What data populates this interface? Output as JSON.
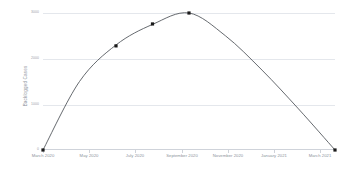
{
  "chart_data": {
    "type": "line",
    "title": "",
    "xlabel": "",
    "ylabel": "Backlogged Cases",
    "grid": true,
    "legend": false,
    "x_tick_labels": [
      "March 2020",
      "May 2020",
      "July 2020",
      "September 2020",
      "November 2020",
      "January 2021",
      "March 2021"
    ],
    "y_tick_labels": [
      "3000",
      "2000",
      "1000",
      "0"
    ],
    "ylim": [
      0,
      3000
    ],
    "series": [
      {
        "name": "Backlogged Cases",
        "x": [
          "March 2020",
          "April 2020",
          "May 2020",
          "June 2020",
          "July 2020",
          "September 2020",
          "November 2020",
          "January 2021",
          "March 2021"
        ],
        "values": [
          0,
          1500,
          2300,
          2750,
          3000,
          2500,
          1750,
          900,
          0
        ],
        "marked_points": [
          {
            "label": "March 2020",
            "value": 0
          },
          {
            "label": "May 2020",
            "value": 2280
          },
          {
            "label": "June 2020",
            "value": 2760
          },
          {
            "label": "July 2020",
            "value": 3000
          },
          {
            "label": "March 2021",
            "value": 0
          }
        ]
      }
    ],
    "colors": {
      "line": "#55595f",
      "marker": "#1a1a1a",
      "gridline": "#e4e7ec",
      "axis": "#cfd3da",
      "tick_text": "#8d939b",
      "background": "#ffffff"
    }
  }
}
